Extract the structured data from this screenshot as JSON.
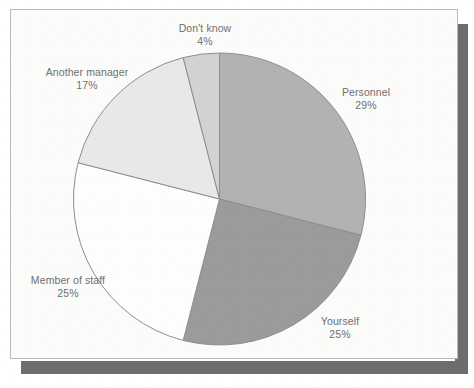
{
  "chart_data": {
    "type": "pie",
    "title": "",
    "subtitle": "",
    "xlabel": "",
    "ylabel": "",
    "legend_position": "none",
    "grid": false,
    "labels_on_slices": false,
    "start_angle_deg": 0,
    "direction": "clockwise",
    "categories": [
      "Personnel",
      "Yourself",
      "Member of staff",
      "Another manager",
      "Don't know"
    ],
    "values": [
      29,
      25,
      25,
      17,
      4
    ],
    "value_unit": "%",
    "slices": [
      {
        "name": "Personnel",
        "value": 29,
        "label": "Personnel",
        "value_label": "29%",
        "color": "#b2b2b2",
        "start_deg": 0,
        "end_deg": 104.4
      },
      {
        "name": "Yourself",
        "value": 25,
        "label": "Yourself",
        "value_label": "25%",
        "color": "#9b9b9b",
        "start_deg": 104.4,
        "end_deg": 194.4
      },
      {
        "name": "Member of staff",
        "value": 25,
        "label": "Member of staff",
        "value_label": "25%",
        "color": "#fdfdfc",
        "start_deg": 194.4,
        "end_deg": 284.4
      },
      {
        "name": "Another manager",
        "value": 17,
        "label": "Another manager",
        "value_label": "17%",
        "color": "#e8e8e8",
        "start_deg": 284.4,
        "end_deg": 345.6
      },
      {
        "name": "Don't know",
        "value": 4,
        "label": "Don't know",
        "value_label": "4%",
        "color": "#d2d2d2",
        "start_deg": 345.6,
        "end_deg": 360
      }
    ]
  },
  "figure": {
    "panel_background": "#fbfbfa",
    "panel_border_color": "#b9b9b9",
    "shadow_color": "#6d6d6d",
    "slice_outline_color": "#8e8e8e",
    "label_text_color": "#6f6f6f"
  }
}
